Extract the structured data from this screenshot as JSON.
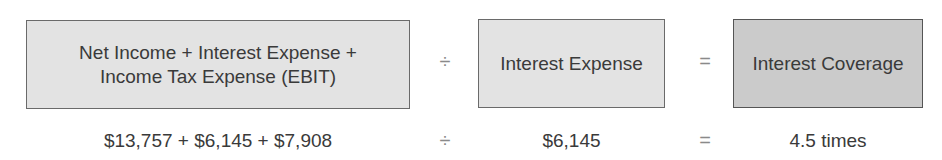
{
  "formula": {
    "title": "Interest Coverage Ratio",
    "terms": [
      {
        "label": "Net Income + Interest Expense + Income Tax Expense (EBIT)",
        "line1": "Net Income + Interest Expense +",
        "line2": "Income Tax Expense (EBIT)",
        "value": "$13,757 + $6,145 + $7,908",
        "shade": "light"
      },
      {
        "label": "Interest Expense",
        "value": "$6,145",
        "shade": "light"
      },
      {
        "label": "Interest Coverage",
        "value": "4.5 times",
        "shade": "dark"
      }
    ],
    "operators": {
      "divide": "÷",
      "equals": "="
    }
  },
  "colors": {
    "light_box": "#e3e3e3",
    "dark_box": "#cbcbcb",
    "border": "#6a6a6a",
    "text": "#3a3a3a"
  }
}
